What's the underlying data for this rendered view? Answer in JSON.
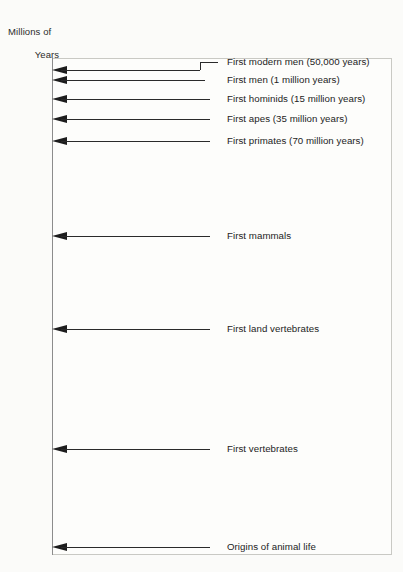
{
  "figure": {
    "axis_title_line1": "Millions of",
    "axis_title_line2": "Years",
    "background_color": "#fbfbf9",
    "line_color": "#2a2a2a",
    "frame_color": "#c9c9c4"
  },
  "chart_data": {
    "type": "bar",
    "title": "Millions of Years",
    "xlabel": "",
    "ylabel": "Millions of Years",
    "orientation": "horizontal-timeline",
    "grid": false,
    "legend": "none",
    "ylim": [
      0,
      625
    ],
    "y_inverted": true,
    "yticks": [
      0,
      100,
      200,
      300,
      400,
      500,
      600
    ],
    "ytick_labels": [
      "0",
      "100",
      "200",
      "300",
      "400",
      "500",
      "600"
    ],
    "categories": [
      "First modern men (50,000 years)",
      "First men (1 million years)",
      "First hominids (15 million years)",
      "First apes (35 million years)",
      "First primates (70 million years)",
      "First mammals",
      "First land vertebrates",
      "First vertebrates",
      "Origins of animal life"
    ],
    "values": [
      0.05,
      1,
      15,
      35,
      70,
      200,
      320,
      480,
      600
    ],
    "annotations": [
      "First modern men (50,000 years)",
      "First men (1 million years)",
      "First hominids (15 million years)",
      "First apes (35 million years)",
      "First primates (70 million years)",
      "First mammals",
      "First land vertebrates",
      "First vertebrates",
      "Origins of animal life"
    ],
    "events": [
      {
        "label": "First modern men (50,000 years)",
        "value": 0.05,
        "y_px": 70,
        "shaft_end_px": 200,
        "stepped": true,
        "step_y_px": 62,
        "step_end_px": 218
      },
      {
        "label": "First men (1 million years)",
        "value": 1,
        "y_px": 80,
        "shaft_end_px": 205,
        "stepped": false
      },
      {
        "label": "First hominids (15 million years)",
        "value": 15,
        "y_px": 99,
        "shaft_end_px": 210,
        "stepped": false
      },
      {
        "label": "First apes (35 million years)",
        "value": 35,
        "y_px": 119,
        "shaft_end_px": 210,
        "stepped": false
      },
      {
        "label": "First primates (70 million years)",
        "value": 70,
        "y_px": 141,
        "shaft_end_px": 210,
        "stepped": false
      },
      {
        "label": "First mammals",
        "value": 200,
        "y_px": 236,
        "shaft_end_px": 210,
        "stepped": false
      },
      {
        "label": "First land vertebrates",
        "value": 320,
        "y_px": 329,
        "shaft_end_px": 210,
        "stepped": false
      },
      {
        "label": "First vertebrates",
        "value": 480,
        "y_px": 449,
        "shaft_end_px": 210,
        "stepped": false
      },
      {
        "label": "Origins of animal life",
        "value": 600,
        "y_px": 547,
        "shaft_end_px": 210,
        "stepped": false
      }
    ],
    "tick_positions_px": [
      {
        "label": "0",
        "y_px": 64,
        "faded": false
      },
      {
        "label": "100",
        "y_px": 159,
        "faded": false
      },
      {
        "label": "200",
        "y_px": 236,
        "faded": false
      },
      {
        "label": "300",
        "y_px": 313,
        "faded": false
      },
      {
        "label": "400",
        "y_px": 389,
        "faded": false
      },
      {
        "label": "500",
        "y_px": 466,
        "faded": true
      },
      {
        "label": "600",
        "y_px": 547,
        "faded": false
      }
    ]
  }
}
